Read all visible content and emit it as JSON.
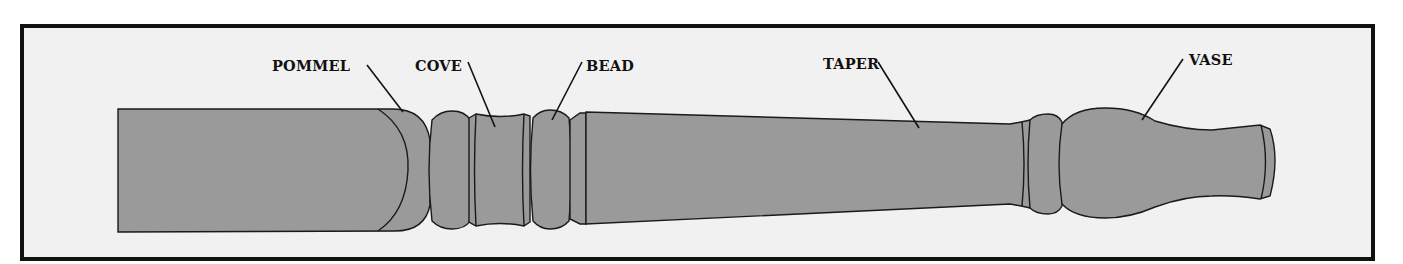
{
  "diagram": {
    "colors": {
      "frame_border": "#111111",
      "background": "#f1f1f1",
      "wood": "#9a9a9a",
      "outline": "#1a1a1a"
    },
    "labels": [
      {
        "id": "pommel",
        "text": "POMMEL"
      },
      {
        "id": "cove",
        "text": "COVE"
      },
      {
        "id": "bead",
        "text": "BEAD"
      },
      {
        "id": "taper",
        "text": "TAPER"
      },
      {
        "id": "vase",
        "text": "VASE"
      }
    ]
  }
}
